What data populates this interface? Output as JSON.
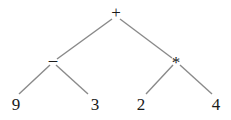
{
  "diagram": {
    "type": "expression-tree",
    "nodes": [
      {
        "id": "root",
        "label": "+",
        "x": 116,
        "y": 13
      },
      {
        "id": "minus",
        "label": "–",
        "x": 53,
        "y": 60
      },
      {
        "id": "times",
        "label": "*",
        "x": 176,
        "y": 60
      },
      {
        "id": "leaf9",
        "label": "9",
        "x": 16,
        "y": 104
      },
      {
        "id": "leaf3",
        "label": "3",
        "x": 95,
        "y": 104
      },
      {
        "id": "leaf2",
        "label": "2",
        "x": 141,
        "y": 104
      },
      {
        "id": "leaf4",
        "label": "4",
        "x": 216,
        "y": 104
      }
    ],
    "edges": [
      {
        "from": "root",
        "to": "minus"
      },
      {
        "from": "root",
        "to": "times"
      },
      {
        "from": "minus",
        "to": "leaf9"
      },
      {
        "from": "minus",
        "to": "leaf3"
      },
      {
        "from": "times",
        "to": "leaf2"
      },
      {
        "from": "times",
        "to": "leaf4"
      }
    ]
  }
}
